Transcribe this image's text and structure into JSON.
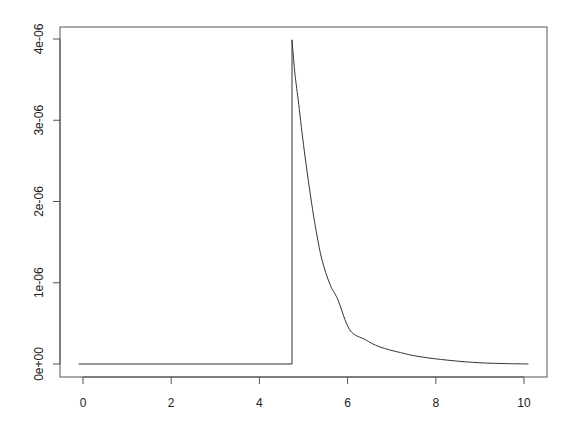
{
  "chart_data": {
    "type": "line",
    "title": "",
    "xlabel": "",
    "ylabel": "",
    "xlim": [
      -0.4,
      10.5
    ],
    "ylim": [
      -1.6e-07,
      4.15e-06
    ],
    "grid": false,
    "legend": null,
    "x_ticks": [
      0,
      2,
      4,
      6,
      8,
      10
    ],
    "x_tick_labels": [
      "0",
      "2",
      "4",
      "6",
      "8",
      "10"
    ],
    "y_ticks": [
      0,
      1e-06,
      2e-06,
      3e-06,
      4e-06
    ],
    "y_tick_labels": [
      "0e+00",
      "1e-06",
      "2e-06",
      "3e-06",
      "4e-06"
    ],
    "series": [
      {
        "name": "density",
        "color": "#333333",
        "x": [
          -0.1,
          4.74,
          4.74,
          4.8,
          4.88,
          5.0,
          5.17,
          5.3,
          5.42,
          5.6,
          5.78,
          6.05,
          6.4,
          6.73,
          7.2,
          7.64,
          8.3,
          9.0,
          9.6,
          10.1
        ],
        "y": [
          0,
          0,
          3.99e-06,
          3.6e-06,
          3.25e-06,
          2.7e-06,
          2.03e-06,
          1.6e-06,
          1.28e-06,
          9.8e-07,
          7.9e-07,
          4.2e-07,
          3e-07,
          2.1e-07,
          1.4e-07,
          9e-08,
          4.5e-08,
          1.5e-08,
          5e-09,
          0.0
        ]
      }
    ]
  },
  "axes": {
    "frame_color": "#555555",
    "text_color": "#222222"
  }
}
